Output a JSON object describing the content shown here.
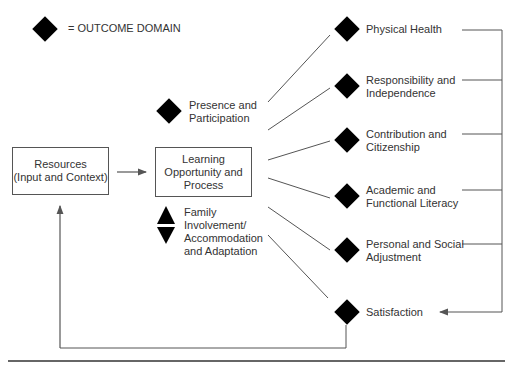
{
  "legend": {
    "label": "= OUTCOME DOMAIN",
    "symbol": "diamond"
  },
  "boxes": {
    "resources": {
      "line1": "Resources",
      "line2": "(Input and Context)"
    },
    "learning": {
      "line1": "Learning",
      "line2": "Opportunity and",
      "line3": "Process"
    }
  },
  "inputs": {
    "presence": {
      "line1": "Presence and",
      "line2": "Participation"
    },
    "family": {
      "line1": "Family",
      "line2": "Involvement/",
      "line3": "Accommodation",
      "line4": "and Adaptation"
    }
  },
  "outcomes": [
    {
      "line1": "Physical Health",
      "line2": ""
    },
    {
      "line1": "Responsibility and",
      "line2": "Independence"
    },
    {
      "line1": "Contribution and",
      "line2": "Citizenship"
    },
    {
      "line1": "Academic and",
      "line2": "Functional Literacy"
    },
    {
      "line1": "Personal and Social",
      "line2": "Adjustment"
    },
    {
      "line1": "Satisfaction",
      "line2": ""
    }
  ],
  "colors": {
    "line": "#555555",
    "symbol": "#000000"
  }
}
